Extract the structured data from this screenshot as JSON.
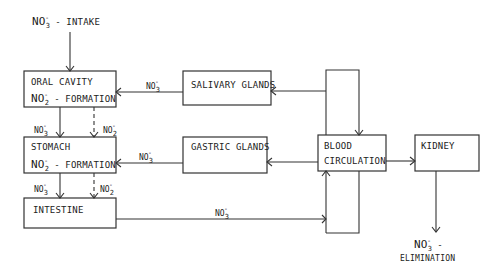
{
  "diagram": {
    "nodes": {
      "intake": {
        "formula": "NO",
        "sub": "3",
        "sup": "-",
        "text": "- INTAKE"
      },
      "oral_cavity": {
        "line1": "ORAL CAVITY",
        "formula": "NO",
        "sub": "2",
        "sup": "-",
        "text": "- FORMATION"
      },
      "stomach": {
        "line1": "STOMACH",
        "formula": "NO",
        "sub": "2",
        "sup": "-",
        "text": "- FORMATION"
      },
      "intestine": {
        "line1": "INTESTINE"
      },
      "salivary_glands": {
        "line1": "SALIVARY GLANDS"
      },
      "gastric_glands": {
        "line1": "GASTRIC GLANDS"
      },
      "blood_circulation": {
        "line1": "BLOOD",
        "line2": "CIRCULATION"
      },
      "kidney": {
        "line1": "KIDNEY"
      },
      "elimination": {
        "formula": "NO",
        "sub": "3",
        "sup": "-",
        "dash": "-",
        "text": "ELIMINATION"
      }
    },
    "edge_labels": {
      "salivary_to_oral": {
        "formula": "NO",
        "sub": "3",
        "sup": "-"
      },
      "oral_to_stomach_nitrate": {
        "formula": "NO",
        "sub": "3",
        "sup": "-"
      },
      "oral_to_stomach_nitrite": {
        "formula": "NO",
        "sub": "2",
        "sup": "-"
      },
      "gastric_to_stomach": {
        "formula": "NO",
        "sub": "3",
        "sup": "-"
      },
      "stomach_to_intestine_nitrate": {
        "formula": "NO",
        "sub": "3",
        "sup": "-"
      },
      "stomach_to_intestine_nitrite": {
        "formula": "NO",
        "sub": "2",
        "sup": "-"
      },
      "intestine_to_blood": {
        "formula": "NO",
        "sub": "3",
        "sup": "-"
      }
    }
  }
}
